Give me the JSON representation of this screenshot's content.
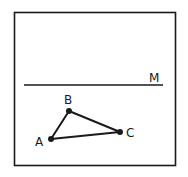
{
  "diagram": {
    "frame": {
      "x": 14,
      "y": 12,
      "width": 161,
      "height": 153,
      "stroke": "#1a1a1a"
    },
    "line": {
      "label": "M",
      "x1": 24,
      "y1": 85,
      "x2": 163,
      "y2": 85
    },
    "points": [
      {
        "label": "A",
        "x": 51,
        "y": 139
      },
      {
        "label": "B",
        "x": 69,
        "y": 111
      },
      {
        "label": "C",
        "x": 120,
        "y": 132
      }
    ],
    "triangle": [
      "A",
      "B",
      "C"
    ]
  }
}
